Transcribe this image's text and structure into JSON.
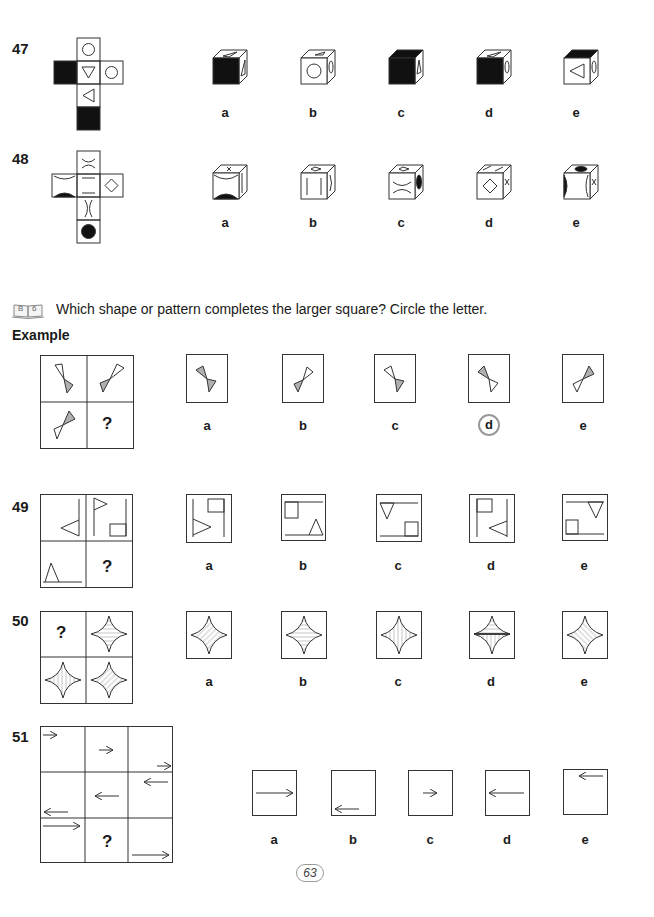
{
  "questions": {
    "q47": {
      "number": "47",
      "options": [
        "a",
        "b",
        "c",
        "d",
        "e"
      ]
    },
    "q48": {
      "number": "48",
      "options": [
        "a",
        "b",
        "c",
        "d",
        "e"
      ]
    },
    "q49": {
      "number": "49",
      "options": [
        "a",
        "b",
        "c",
        "d",
        "e"
      ],
      "missing": "?"
    },
    "q50": {
      "number": "50",
      "options": [
        "a",
        "b",
        "c",
        "d",
        "e"
      ],
      "missing": "?"
    },
    "q51": {
      "number": "51",
      "options": [
        "a",
        "b",
        "c",
        "d",
        "e"
      ],
      "missing": "?"
    }
  },
  "section": {
    "badge_icon": "book-icon",
    "badge_text": [
      "B",
      "6"
    ],
    "instruction": "Which shape or pattern completes the larger square? Circle the letter.",
    "example_title": "Example",
    "example": {
      "options": [
        "a",
        "b",
        "c",
        "d",
        "e"
      ],
      "missing": "?",
      "answer": "d"
    }
  },
  "footer": {
    "page_number": "63"
  },
  "colors": {
    "ink": "#1a1a1a",
    "line": "#555555",
    "shade": "#b0b0b0",
    "circle": "#999999"
  }
}
